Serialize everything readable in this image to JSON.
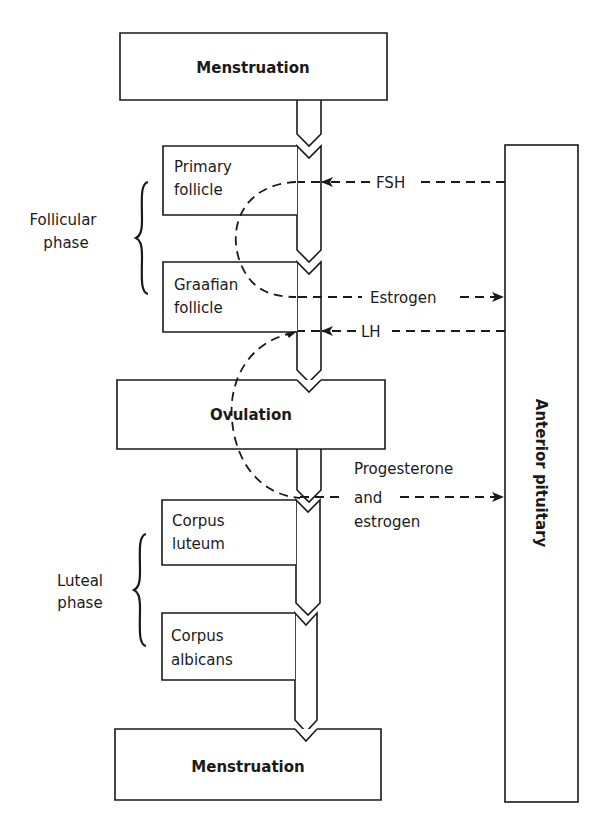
{
  "diagram": {
    "stages": [
      {
        "id": "menstruation-top",
        "label": "Menstruation",
        "bold": true
      },
      {
        "id": "primary-follicle",
        "label_lines": [
          "Primary",
          "follicle"
        ],
        "bold": false
      },
      {
        "id": "graafian-follicle",
        "label_lines": [
          "Graafian",
          "follicle"
        ],
        "bold": false
      },
      {
        "id": "ovulation",
        "label": "Ovulation",
        "bold": true
      },
      {
        "id": "corpus-luteum",
        "label_lines": [
          "Corpus",
          "luteum"
        ],
        "bold": false
      },
      {
        "id": "corpus-albicans",
        "label_lines": [
          "Corpus",
          "albicans"
        ],
        "bold": false
      },
      {
        "id": "menstruation-bottom",
        "label": "Menstruation",
        "bold": true
      }
    ],
    "phases": [
      {
        "id": "follicular-phase",
        "label_lines": [
          "Follicular",
          "phase"
        ],
        "spans": [
          "primary-follicle",
          "graafian-follicle"
        ]
      },
      {
        "id": "luteal-phase",
        "label_lines": [
          "Luteal",
          "phase"
        ],
        "spans": [
          "corpus-luteum",
          "corpus-albicans"
        ]
      }
    ],
    "gland": {
      "id": "anterior-pituitary",
      "label": "Anterior pituitary"
    },
    "hormones": [
      {
        "id": "fsh",
        "label_lines": [
          "FSH"
        ],
        "from": "anterior-pituitary",
        "to": "primary-follicle"
      },
      {
        "id": "estrogen",
        "label_lines": [
          "Estrogen"
        ],
        "from": "graafian-follicle",
        "to": "anterior-pituitary"
      },
      {
        "id": "lh",
        "label_lines": [
          "LH"
        ],
        "from": "anterior-pituitary",
        "to": "graafian-follicle"
      },
      {
        "id": "progesterone-estrogen",
        "label_lines": [
          "Progesterone",
          "and",
          "estrogen"
        ],
        "from": "corpus-luteum",
        "to": "anterior-pituitary"
      }
    ]
  },
  "text": {
    "menstruation_top": "Menstruation",
    "primary_1": "Primary",
    "primary_2": "follicle",
    "graafian_1": "Graafian",
    "graafian_2": "follicle",
    "ovulation": "Ovulation",
    "luteum_1": "Corpus",
    "luteum_2": "luteum",
    "albicans_1": "Corpus",
    "albicans_2": "albicans",
    "menstruation_bottom": "Menstruation",
    "follicular_1": "Follicular",
    "follicular_2": "phase",
    "luteal_1": "Luteal",
    "luteal_2": "phase",
    "pituitary": "Anterior pituitary",
    "fsh": "FSH",
    "estrogen": "Estrogen",
    "lh": "LH",
    "prog_1": "Progesterone",
    "prog_2": "and",
    "prog_3": "estrogen"
  },
  "colors": {
    "ink": "#1a1a1a",
    "background": "#ffffff"
  }
}
